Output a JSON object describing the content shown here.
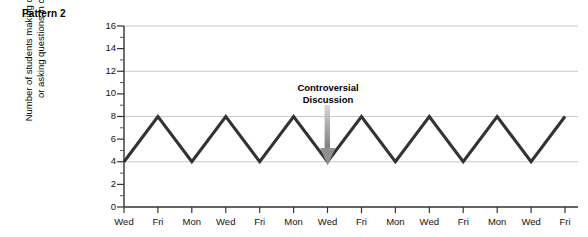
{
  "figure": {
    "pattern_label": "Pattern 2"
  },
  "annotation": {
    "line1": "Controversial",
    "line2": "Discussion",
    "target_index": 6,
    "color": "#8a8a8a"
  },
  "colors": {
    "line": "#333333",
    "grid": "#c9c9c9",
    "axis": "#333333",
    "arrow": "#8a8a8a",
    "text": "#111111",
    "background": "#ffffff"
  },
  "chart_data": {
    "type": "line",
    "title": "Pattern 2",
    "xlabel": "",
    "ylabel": "Number of students making comments or asking questions in class",
    "ylabel_line1": "Number of students making comments",
    "ylabel_line2": "or asking questions in class",
    "categories": [
      "Wed",
      "Fri",
      "Mon",
      "Wed",
      "Fri",
      "Mon",
      "Wed",
      "Fri",
      "Mon",
      "Wed",
      "Fri",
      "Mon",
      "Wed",
      "Fri"
    ],
    "values": [
      4,
      8,
      4,
      8,
      4,
      8,
      4,
      8,
      4,
      8,
      4,
      8,
      4,
      8
    ],
    "ylim": [
      0,
      16
    ],
    "yticks": [
      0,
      2,
      4,
      6,
      8,
      10,
      12,
      14,
      16
    ],
    "ytick_labels": [
      "0",
      "2",
      "4",
      "6",
      "8",
      "10",
      "12",
      "14",
      "16"
    ],
    "yminor_ticks": [
      1,
      3,
      5,
      7,
      9,
      11,
      13,
      15
    ],
    "gridlines": [
      4,
      8,
      12,
      16
    ],
    "grid": true,
    "legend": false,
    "annotations": [
      {
        "text": "Controversial Discussion",
        "points_to_category": "Wed",
        "points_to_index": 6,
        "points_to_value": 4
      }
    ]
  }
}
